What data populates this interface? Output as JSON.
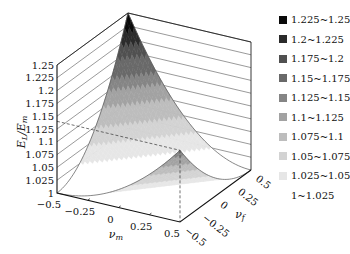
{
  "chart_data": {
    "type": "surface3d",
    "title": "",
    "zlabel": "E_L / E_m",
    "xlabel": "ν_m",
    "ylabel": "ν_f",
    "x_ticks": [
      "-0.5",
      "-0.25",
      "0",
      "0.25",
      "0.5"
    ],
    "y_ticks": [
      "-0.5",
      "-0.25",
      "0",
      "0.25",
      "0.5"
    ],
    "z_ticks": [
      "1",
      "1.025",
      "1.05",
      "1.075",
      "1.1",
      "1.125",
      "1.15",
      "1.175",
      "1.2",
      "1.225",
      "1.25"
    ],
    "xlim": [
      -0.5,
      0.5
    ],
    "ylim": [
      -0.5,
      0.5
    ],
    "zlim": [
      1,
      1.25
    ],
    "peaks": [
      {
        "nu_m": -0.5,
        "nu_f": 0.5,
        "value": 1.25
      },
      {
        "nu_m": 0.5,
        "nu_f": -0.5,
        "value": 1.14
      }
    ],
    "legend_position": "right",
    "legend": [
      {
        "label": "1.225~1.25",
        "color": "#0a0a0a"
      },
      {
        "label": "1.2~1.225",
        "color": "#2b2b2b"
      },
      {
        "label": "1.175~1.2",
        "color": "#505050"
      },
      {
        "label": "1.15~1.175",
        "color": "#696969"
      },
      {
        "label": "1.125~1.15",
        "color": "#858585"
      },
      {
        "label": "1.1~1.125",
        "color": "#a2a2a2"
      },
      {
        "label": "1.075~1.1",
        "color": "#bdbdbd"
      },
      {
        "label": "1.05~1.075",
        "color": "#d3d3d3"
      },
      {
        "label": "1.025~1.05",
        "color": "#e6e6e6"
      },
      {
        "label": "1~1.025",
        "color": "#ffffff"
      }
    ]
  }
}
